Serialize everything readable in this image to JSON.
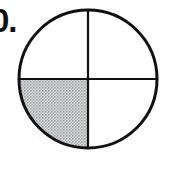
{
  "figure": {
    "problem_number_label": "0.",
    "type": "fraction-circle",
    "background_color": "#ffffff",
    "outline_color": "#111111",
    "shade_color": "#c2c6c6",
    "shade_pattern": "halftone-dots",
    "circle": {
      "center_x": 88,
      "center_y": 79,
      "radius": 69,
      "outline_width": 3
    },
    "divider_lines": {
      "count": 2,
      "orientation": [
        "vertical-diameter",
        "horizontal-diameter"
      ],
      "line_width": 2,
      "color": "#111111"
    },
    "parts": {
      "total": 4,
      "shaded": 1,
      "fraction": "1/4"
    },
    "quadrants": [
      {
        "name": "top-left",
        "shaded": false
      },
      {
        "name": "top-right",
        "shaded": false
      },
      {
        "name": "bottom-left",
        "shaded": true
      },
      {
        "name": "bottom-right",
        "shaded": false
      }
    ]
  }
}
